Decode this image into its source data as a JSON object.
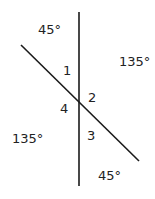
{
  "diagram": {
    "title": "",
    "lines": [
      {
        "name": "vertical-line",
        "x1": 79,
        "y1": 12,
        "x2": 79,
        "y2": 186
      },
      {
        "name": "transversal-line",
        "x1": 21,
        "y1": 45,
        "x2": 139,
        "y2": 161
      }
    ],
    "angle_labels": {
      "a1": "1",
      "a2": "2",
      "a3": "3",
      "a4": "4"
    },
    "measure_labels": {
      "top_left": "45°",
      "top_right": "135°",
      "bottom_left": "135°",
      "bottom_right": "45°"
    },
    "stroke_color": "#1a1a1a"
  }
}
